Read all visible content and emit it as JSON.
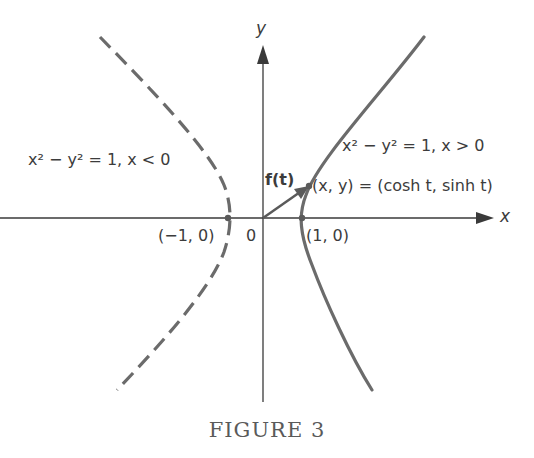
{
  "figure": {
    "caption": "FIGURE 3",
    "axes": {
      "x_label": "x",
      "y_label": "y",
      "origin_label": "0"
    },
    "points": {
      "left_vertex": "(−1, 0)",
      "right_vertex": "(1, 0)",
      "point_label": "(x, y) = (cosh t, sinh t)"
    },
    "vector_label": "f(t)",
    "branches": {
      "left": {
        "eq": "x² − y² = 1, x < 0",
        "style": "dashed"
      },
      "right": {
        "eq": "x² − y² = 1, x > 0",
        "style": "solid"
      }
    },
    "colors": {
      "curve": "#6b6b6b",
      "axis": "#3a3a3a",
      "text": "#3c3c3c"
    }
  }
}
